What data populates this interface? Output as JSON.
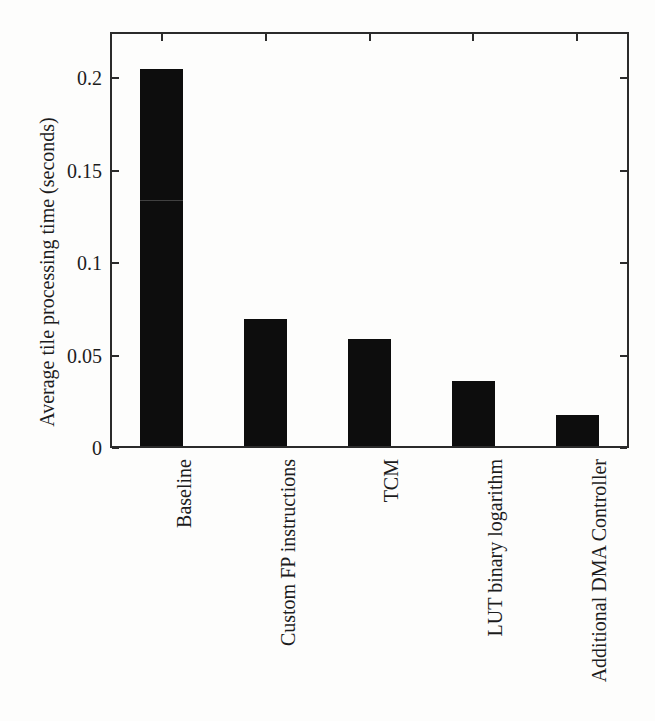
{
  "figure": {
    "background": "#fdfdfc",
    "text_color": "#1c1c1c",
    "frame_color": "#2b2b2b"
  },
  "chart_data": {
    "type": "bar",
    "categories": [
      "Baseline",
      "Custom FP instructions",
      "TCM",
      "LUT binary logarithm",
      "Additional DMA Controller"
    ],
    "values": [
      0.205,
      0.07,
      0.059,
      0.036,
      0.018
    ],
    "title": "",
    "xlabel": "",
    "ylabel": "Average tile processing time (seconds)",
    "ylim": [
      0,
      0.225
    ],
    "yticks": {
      "values": [
        0,
        0.05,
        0.1,
        0.15,
        0.2
      ],
      "labels": [
        "0",
        "0.05",
        "0.1",
        "0.15",
        "0.2"
      ]
    },
    "bar_color": "#0d0d0d",
    "bar_width_px": 43,
    "grid": false,
    "legend": "none",
    "tick_style": "inward, mirrored on top and right axes",
    "x_label_rotation_deg": 90
  }
}
